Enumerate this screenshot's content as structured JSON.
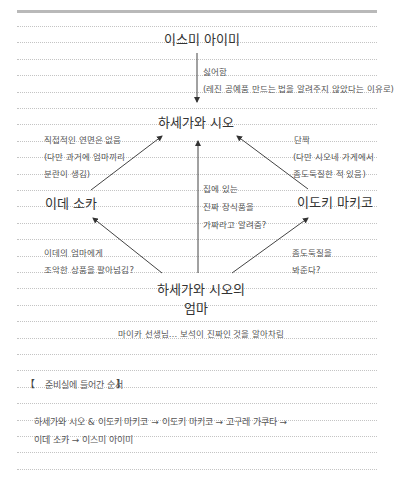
{
  "diagram": {
    "nodes": {
      "top": "이스미 아이미",
      "center_top": "하세가와 시오",
      "left": "이데 소카",
      "right": "이도키 마키코",
      "bottom_line1": "하세가와 시오의",
      "bottom_line2": "엄마"
    },
    "edges": {
      "top_to_center": {
        "label_line1": "싫어함",
        "label_line2": "(레진 공예품 만드는 법을 알려주지 않았다는 이유로)"
      },
      "left_to_center": {
        "label_line1": "직접적인 연면은 없음",
        "label_line2": "(다만 과거에 엄마끼리",
        "label_line3": "분란이 생김)"
      },
      "right_to_center": {
        "label_line1": "단짝",
        "label_line2": "(다만 시오네 가게에서",
        "label_line3": "좀도둑질한 적 있음)"
      },
      "bottom_to_center": {
        "label_line1": "집에 있는",
        "label_line2": "진짜 장식품을",
        "label_line3": "가짜라고 알려줌?"
      },
      "bottom_to_left": {
        "label_line1": "이데의 엄마에게",
        "label_line2": "조악한 상품을 팔아넘김?"
      },
      "bottom_to_right": {
        "label_line1": "좀도둑질을",
        "label_line2": "봐준다?"
      }
    },
    "note": "마이카 선생님… 보석이 진짜인 것을 알아차림"
  },
  "section": {
    "title_open": "【",
    "title": "준비실에 들어간 순서",
    "title_close": "】",
    "order_line1": "하세가와 시오 & 이도키 마키코 → 이도키 마키코 → 고구레 가쿠타 →",
    "order_line2": "이데 소카 → 이스미 아이미"
  }
}
